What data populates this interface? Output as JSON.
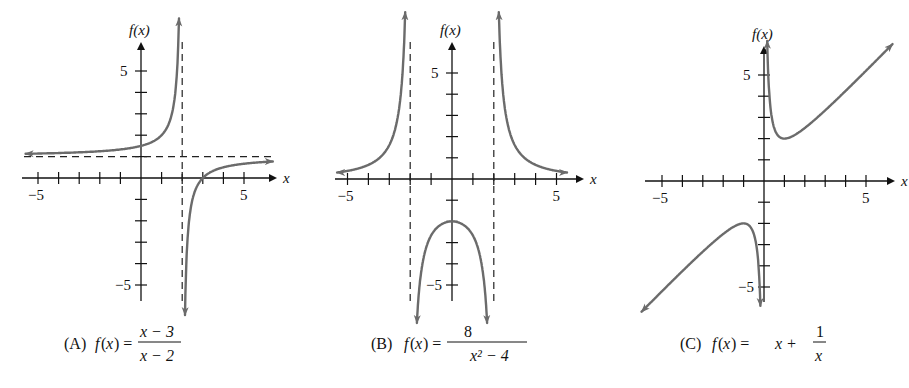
{
  "chart_data": [
    {
      "type": "line",
      "panel": "A",
      "caption_prefix": "(A)",
      "function": "f(x) = (x - 3)/(x - 2)",
      "numerator": "x − 3",
      "denominator": "x − 2",
      "xlabel": "x",
      "ylabel": "f(x)",
      "xlim": [
        -6,
        6.5
      ],
      "ylim": [
        -6,
        6.5
      ],
      "x_tick_labels": [
        "−5",
        "5"
      ],
      "y_tick_labels": [
        "5",
        "−5"
      ],
      "asymptotes": {
        "vertical": [
          2
        ],
        "horizontal": [
          1
        ]
      },
      "x_intercept": 3,
      "y_intercept": 1.5
    },
    {
      "type": "line",
      "panel": "B",
      "caption_prefix": "(B)",
      "function": "f(x) = 8/(x^2 - 4)",
      "numerator": "8",
      "denominator": "x² − 4",
      "xlabel": "x",
      "ylabel": "f(x)",
      "xlim": [
        -6,
        6.5
      ],
      "ylim": [
        -6,
        6.5
      ],
      "x_tick_labels": [
        "−5",
        "5"
      ],
      "y_tick_labels": [
        "5",
        "−5"
      ],
      "asymptotes": {
        "vertical": [
          -2,
          2
        ],
        "horizontal": [
          0
        ]
      },
      "y_intercept": -2
    },
    {
      "type": "line",
      "panel": "C",
      "caption_prefix": "(C)",
      "function": "f(x) = x + 1/x",
      "lead": "x +",
      "numerator": "1",
      "denominator": "x",
      "xlabel": "x",
      "ylabel": "f(x)",
      "xlim": [
        -6,
        6.5
      ],
      "ylim": [
        -6,
        6.5
      ],
      "x_tick_labels": [
        "−5",
        "5"
      ],
      "y_tick_labels": [
        "5",
        "−5"
      ],
      "local_min": [
        1,
        2
      ],
      "local_max": [
        -1,
        -2
      ]
    }
  ],
  "colors": {
    "curve": "#6b6b6b",
    "axis": "#111111"
  }
}
